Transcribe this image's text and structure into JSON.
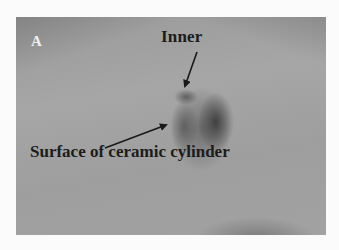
{
  "figure": {
    "panel_label": "A",
    "annotations": [
      {
        "label": "Inner",
        "arrow_from": [
          197,
          52
        ],
        "arrow_to": [
          184,
          88
        ]
      },
      {
        "label": "Surface of ceramic cylinder",
        "arrow_from": [
          105,
          148
        ],
        "arrow_to": [
          168,
          124
        ]
      }
    ],
    "colors": {
      "background": "#fbfbfb",
      "photo_gray": "#a2a2a2",
      "annotation_text": "#1c1c1c",
      "panel_letter": "#eeeeee"
    }
  }
}
